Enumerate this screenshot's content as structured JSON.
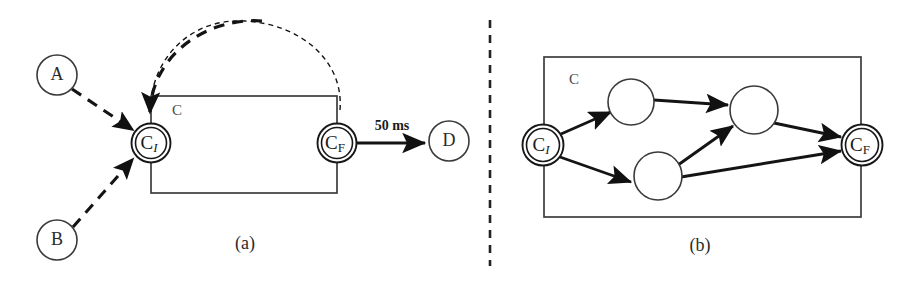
{
  "figure": {
    "width": 920,
    "height": 285,
    "background": "#ffffff",
    "ink_color": "#1a1a1a",
    "light_ink_color": "#4a4a4a"
  },
  "panel_a": {
    "caption": "(a)",
    "container_label": "C",
    "nodes": [
      {
        "id": "A",
        "label": "A",
        "type": "plain-circle",
        "cx": 57,
        "cy": 75,
        "r": 20
      },
      {
        "id": "B",
        "label": "B",
        "type": "plain-circle",
        "cx": 57,
        "cy": 240,
        "r": 20
      },
      {
        "id": "CI",
        "label": "C",
        "sub": "I",
        "sub_style": "italic",
        "type": "double-circle",
        "cx": 151,
        "cy": 143,
        "r": 19
      },
      {
        "id": "CF",
        "label": "C",
        "sub": "F",
        "sub_style": "roman",
        "type": "double-circle",
        "cx": 337,
        "cy": 143,
        "r": 19
      },
      {
        "id": "D",
        "label": "D",
        "type": "plain-circle",
        "cx": 449,
        "cy": 141,
        "r": 20
      }
    ],
    "edges": [
      {
        "from": "A",
        "to": "CI",
        "style": "dashed-thick",
        "label": ""
      },
      {
        "from": "B",
        "to": "CI",
        "style": "dashed-thick",
        "label": ""
      },
      {
        "from": "CF",
        "to": "CI",
        "style": "dashed-arc",
        "label": ""
      },
      {
        "from": "CF",
        "to": "D",
        "style": "solid-thick",
        "label": "50 ms"
      }
    ],
    "edge_label": "50 ms"
  },
  "panel_b": {
    "caption": "(b)",
    "container_label": "C",
    "nodes": [
      {
        "id": "CI",
        "label": "C",
        "sub": "I",
        "sub_style": "italic",
        "type": "double-circle",
        "cx": 543,
        "cy": 145,
        "r": 20
      },
      {
        "id": "N1",
        "label": "",
        "type": "plain-circle",
        "cx": 631,
        "cy": 102,
        "r": 23
      },
      {
        "id": "N2",
        "label": "",
        "type": "plain-circle",
        "cx": 754,
        "cy": 110,
        "r": 24
      },
      {
        "id": "N3",
        "label": "",
        "type": "plain-circle",
        "cx": 658,
        "cy": 176,
        "r": 24
      },
      {
        "id": "CF",
        "label": "C",
        "sub": "F",
        "sub_style": "roman",
        "type": "double-circle",
        "cx": 862,
        "cy": 145,
        "r": 20
      }
    ],
    "edges": [
      {
        "from": "CI",
        "to": "N1",
        "style": "solid-thick"
      },
      {
        "from": "N1",
        "to": "N2",
        "style": "solid-thick"
      },
      {
        "from": "N2",
        "to": "CF",
        "style": "solid-thick"
      },
      {
        "from": "CI",
        "to": "N3",
        "style": "solid-thick"
      },
      {
        "from": "N3",
        "to": "N2",
        "style": "solid-thick"
      },
      {
        "from": "N3",
        "to": "CF",
        "style": "solid-thick"
      }
    ]
  },
  "divider": {
    "orientation": "vertical",
    "style": "dashed",
    "x": 490,
    "y_start": 20,
    "y_end": 266
  }
}
